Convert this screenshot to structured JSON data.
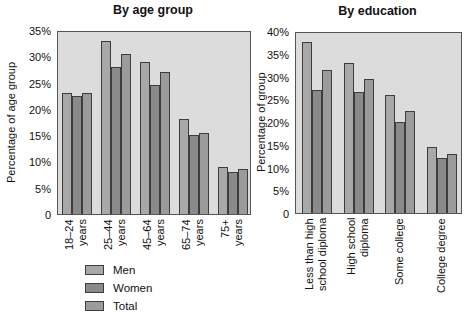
{
  "colors": {
    "men": "#a8a8a8",
    "women": "#8a8a8a",
    "total": "#9b9b9b",
    "plot_background": "#dcdcdc",
    "bar_border": "#3d3d3d",
    "text": "#111111"
  },
  "legend": {
    "items": [
      {
        "label": "Men",
        "color": "#a8a8a8"
      },
      {
        "label": "Women",
        "color": "#8a8a8a"
      },
      {
        "label": "Total",
        "color": "#9b9b9b"
      }
    ]
  },
  "chart_data": [
    {
      "type": "bar",
      "title": "By age group",
      "ylabel": "Percentage of age group",
      "xlabel": "",
      "ylim": [
        0,
        35
      ],
      "ytick_step": 5,
      "ytick_suffix": "%",
      "zero_label": "0",
      "grid": false,
      "legend_position": "bottom-left",
      "categories": [
        "18–24\nyears",
        "25–44\nyears",
        "45–64\nyears",
        "65–74\nyears",
        "75+\nyears"
      ],
      "series": [
        {
          "name": "Men",
          "color": "#a8a8a8",
          "values": [
            23,
            33,
            29,
            18,
            9
          ]
        },
        {
          "name": "Women",
          "color": "#8a8a8a",
          "values": [
            22.5,
            28,
            24.5,
            15,
            8
          ]
        },
        {
          "name": "Total",
          "color": "#9b9b9b",
          "values": [
            23,
            30.5,
            27,
            15.5,
            8.5
          ]
        }
      ]
    },
    {
      "type": "bar",
      "title": "By education",
      "ylabel": "Percentage of group",
      "xlabel": "",
      "ylim": [
        0,
        40
      ],
      "ytick_step": 5,
      "ytick_suffix": "%",
      "zero_label": "0",
      "grid": false,
      "legend_position": "shared",
      "categories": [
        "Less than high\nschool diploma",
        "High school\ndiploma",
        "Some college",
        "College degree"
      ],
      "series": [
        {
          "name": "Men",
          "color": "#a8a8a8",
          "values": [
            37.5,
            33,
            26,
            14.5
          ]
        },
        {
          "name": "Women",
          "color": "#8a8a8a",
          "values": [
            27,
            26.5,
            20,
            12
          ]
        },
        {
          "name": "Total",
          "color": "#9b9b9b",
          "values": [
            31.5,
            29.5,
            22.5,
            13
          ]
        }
      ]
    }
  ]
}
